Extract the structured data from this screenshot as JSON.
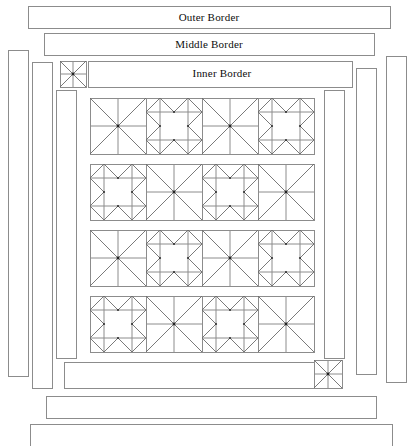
{
  "diagram": {
    "name": "quilt-assembly-diagram",
    "background_color": "#ffffff",
    "line_color": "#8c8c8c",
    "diagonal_color": "#6b6b6b",
    "label_color": "#0d0d0d"
  },
  "labels": {
    "outer_border": "Outer Border",
    "middle_border": "Middle Border",
    "inner_border": "Inner Border"
  },
  "horizontal_borders": [
    {
      "name": "outer-border-top",
      "label": "Outer Border",
      "x": 28,
      "y": 6,
      "width": 362,
      "height": 22
    },
    {
      "name": "middle-border-top",
      "label": "Middle Border",
      "x": 44,
      "y": 33,
      "width": 330,
      "height": 22
    },
    {
      "name": "inner-border-top",
      "label": "Inner Border",
      "x": 88,
      "y": 61,
      "width": 264,
      "height": 26
    },
    {
      "name": "inner-border-bottom",
      "label": "",
      "x": 64,
      "y": 362,
      "width": 258,
      "height": 26
    },
    {
      "name": "middle-border-bottom",
      "label": "",
      "x": 46,
      "y": 396,
      "width": 330,
      "height": 22
    },
    {
      "name": "outer-border-bottom",
      "label": "",
      "x": 30,
      "y": 424,
      "width": 362,
      "height": 22
    }
  ],
  "vertical_borders": [
    {
      "name": "outer-border-left",
      "x": 8,
      "y": 50,
      "width": 20,
      "height": 326
    },
    {
      "name": "middle-border-left",
      "x": 32,
      "y": 62,
      "width": 20,
      "height": 326
    },
    {
      "name": "inner-border-left",
      "x": 56,
      "y": 90,
      "width": 20,
      "height": 268
    },
    {
      "name": "inner-border-right",
      "x": 324,
      "y": 90,
      "width": 20,
      "height": 268
    },
    {
      "name": "middle-border-right",
      "x": 356,
      "y": 68,
      "width": 20,
      "height": 306
    },
    {
      "name": "outer-border-right",
      "x": 386,
      "y": 56,
      "width": 20,
      "height": 326
    }
  ],
  "corner_blocks": [
    {
      "name": "corner-block-top-left",
      "x": 60,
      "y": 61,
      "size": 26
    },
    {
      "name": "corner-block-bottom-right",
      "x": 314,
      "y": 360,
      "size": 28
    }
  ],
  "center_panel": {
    "name": "center-block-grid",
    "x": 90,
    "y": 98,
    "rows": 4,
    "columns": 4,
    "block_size": 56,
    "row_gap": 10,
    "row_tops": [
      98,
      164,
      230,
      296
    ],
    "column_lefts": [
      90,
      146,
      202,
      258
    ],
    "block_types": [
      [
        "ohio-star",
        "sawtooth-star",
        "ohio-star",
        "sawtooth-star"
      ],
      [
        "sawtooth-star",
        "ohio-star",
        "sawtooth-star",
        "ohio-star"
      ],
      [
        "ohio-star",
        "sawtooth-star",
        "ohio-star",
        "sawtooth-star"
      ],
      [
        "sawtooth-star",
        "ohio-star",
        "sawtooth-star",
        "ohio-star"
      ]
    ]
  }
}
